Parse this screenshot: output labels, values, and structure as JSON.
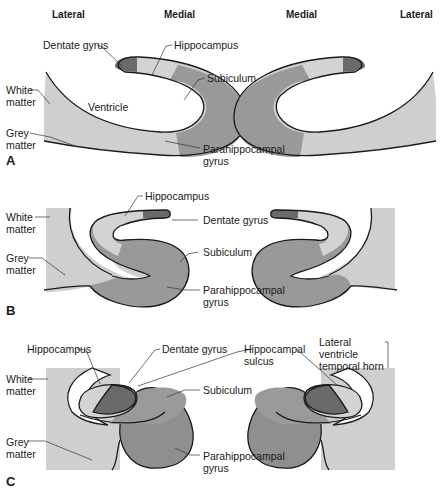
{
  "header": {
    "left_lateral": "Lateral",
    "left_medial": "Medial",
    "right_medial": "Medial",
    "right_lateral": "Lateral"
  },
  "colors": {
    "grey_matter": "#cfcfcf",
    "hippocampus": "#d3d3d3",
    "dentate": "#6a6a6a",
    "subiculum": "#9a9a9a",
    "parahippocampal": "#8f8f8f",
    "outline": "#1a1a1a"
  },
  "panels": {
    "A": {
      "letter": "A",
      "labels": {
        "dentate_gyrus": "Dentate gyrus",
        "hippocampus": "Hippocampus",
        "subiculum": "Subiculum",
        "ventricle": "Ventricle",
        "white_matter": "White matter",
        "grey_matter": "Grey matter",
        "parahippocampal_gyrus": "Parahippocampal gyrus"
      }
    },
    "B": {
      "letter": "B",
      "labels": {
        "hippocampus": "Hippocampus",
        "dentate_gyrus": "Dentate gyrus",
        "white_matter": "White matter",
        "grey_matter": "Grey matter",
        "subiculum": "Subiculum",
        "parahippocampal_gyrus": "Parahippocampal gyrus"
      }
    },
    "C": {
      "letter": "C",
      "labels": {
        "hippocampus": "Hippocampus",
        "dentate_gyrus": "Dentate gyrus",
        "hippocampal_sulcus": "Hippocampal sulcus",
        "lateral_ventricle_temporal_horn": "Lateral ventricle temporal horn",
        "white_matter": "White matter",
        "subiculum": "Subiculum",
        "grey_matter": "Grey matter",
        "parahippocampal_gyrus": "Parahippocampal gyrus"
      }
    }
  }
}
